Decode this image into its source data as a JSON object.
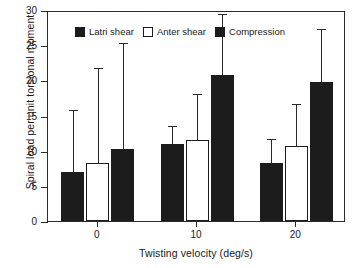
{
  "chart_data": {
    "type": "bar",
    "title": "",
    "subtitle": "",
    "xlabel": "Twisting velocity (deg/s)",
    "ylabel": "Spiral load per unit torsional moment",
    "categories": [
      "0",
      "10",
      "20"
    ],
    "ylim": [
      0,
      30
    ],
    "yticks": [
      0,
      5,
      10,
      15,
      20,
      25,
      30
    ],
    "ytick_labels": [
      "0",
      "5",
      "10",
      "15",
      "20",
      "25",
      "30"
    ],
    "grid": false,
    "legend_position": "top-inside",
    "orientation": "vertical",
    "error_bars": "upper-only",
    "series": [
      {
        "name": "Latrl shear",
        "style": "filled",
        "color": "#1c1c1c",
        "values": [
          7.0,
          10.9,
          8.3
        ],
        "error_upper": [
          16.0,
          13.8,
          11.9
        ]
      },
      {
        "name": "Anter shear",
        "style": "open",
        "color": "#ffffff",
        "values": [
          8.2,
          11.5,
          10.7
        ],
        "error_upper": [
          22.0,
          18.3,
          16.9
        ]
      },
      {
        "name": "Compression",
        "style": "filled",
        "color": "#1c1c1c",
        "values": [
          10.2,
          20.8,
          19.8
        ],
        "error_upper": [
          25.6,
          29.7,
          27.6
        ]
      }
    ]
  },
  "legend": {
    "items": [
      {
        "label": "Latri shear",
        "style": "filled"
      },
      {
        "label": "Anter shear",
        "style": "open"
      },
      {
        "label": "Compression",
        "style": "filled"
      }
    ]
  },
  "axes": {
    "y_label": "Spiral load per unit torsional moment",
    "x_label": "Twisting velocity (deg/s)",
    "y_tick_labels": [
      "0",
      "5",
      "10",
      "15",
      "20",
      "25",
      "30"
    ],
    "x_tick_labels": [
      "0",
      "10",
      "20"
    ]
  },
  "colors": {
    "ink": "#1c1c1c",
    "axis": "#2b2b2b",
    "background": "#ffffff"
  }
}
